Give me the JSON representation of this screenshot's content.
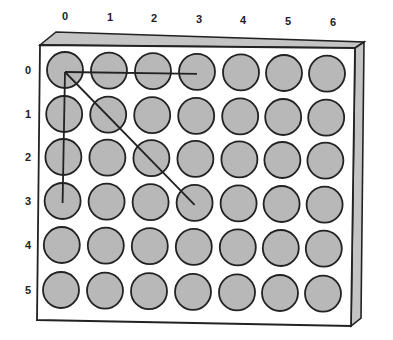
{
  "diagram": {
    "type": "grid-board",
    "column_labels": [
      "0",
      "1",
      "2",
      "3",
      "4",
      "5",
      "6"
    ],
    "row_labels": [
      "0",
      "1",
      "2",
      "3",
      "4",
      "5"
    ],
    "rows": 6,
    "columns": 7,
    "lines": [
      {
        "name": "horizontal",
        "from": [
          0,
          0
        ],
        "to": [
          0,
          3
        ]
      },
      {
        "name": "vertical",
        "from": [
          0,
          0
        ],
        "to": [
          3,
          0
        ]
      },
      {
        "name": "diagonal",
        "from": [
          0,
          0
        ],
        "to": [
          3,
          3
        ]
      }
    ],
    "colors": {
      "hole_fill": "#b8b8b8",
      "hole_stroke": "#222222",
      "board_face": "#ffffff",
      "board_bevel": "#c4c4c4",
      "line": "#222222"
    }
  }
}
